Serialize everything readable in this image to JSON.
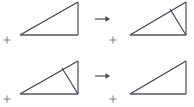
{
  "canvas": {
    "width": 194,
    "height": 107,
    "background": "#ffffff",
    "description": "Two-row geometric transformation diagram of right triangles"
  },
  "style": {
    "outline_color": "#3b3b46",
    "base_color": "#55555f",
    "cevian_color": "#3b3b46",
    "origin_color": "#6d6d78",
    "arrow_color": "#4a4a55"
  },
  "rows": [
    {
      "id": "row-top",
      "arrow": {
        "glyph": "→",
        "label": "transforms-to",
        "x1": 95,
        "y1": 19,
        "x2": 109,
        "y2": 19
      },
      "before": {
        "id": "figure-top-left",
        "label": "right-triangle-plain",
        "has_cevian": false,
        "vertices": {
          "bottom_left": [
            20,
            35
          ],
          "bottom_right": [
            78,
            35
          ],
          "apex": [
            78,
            2
          ]
        },
        "origin_marker": [
          7,
          40
        ]
      },
      "after": {
        "id": "figure-top-right",
        "label": "right-triangle-with-cevian",
        "has_cevian": true,
        "vertices": {
          "bottom_left": [
            130,
            35
          ],
          "bottom_right": [
            186,
            35
          ],
          "apex": [
            186,
            2
          ]
        },
        "cevian": {
          "from": [
            170,
            9
          ],
          "to": [
            186,
            35
          ]
        },
        "origin_marker": [
          113,
          40
        ]
      }
    },
    {
      "id": "row-bottom",
      "arrow": {
        "glyph": "→",
        "label": "transforms-to",
        "x1": 95,
        "y1": 76,
        "x2": 109,
        "y2": 76
      },
      "before": {
        "id": "figure-bottom-left",
        "label": "right-triangle-with-cevian",
        "has_cevian": true,
        "vertices": {
          "bottom_left": [
            20,
            94
          ],
          "bottom_right": [
            78,
            94
          ],
          "apex": [
            78,
            61
          ]
        },
        "cevian": {
          "from": [
            62,
            68
          ],
          "to": [
            78,
            94
          ]
        },
        "origin_marker": [
          7,
          99
        ]
      },
      "after": {
        "id": "figure-bottom-right",
        "label": "right-triangle-plain",
        "has_cevian": false,
        "vertices": {
          "bottom_left": [
            130,
            94
          ],
          "bottom_right": [
            186,
            94
          ],
          "apex": [
            186,
            61
          ]
        },
        "origin_marker": [
          113,
          99
        ]
      }
    }
  ]
}
